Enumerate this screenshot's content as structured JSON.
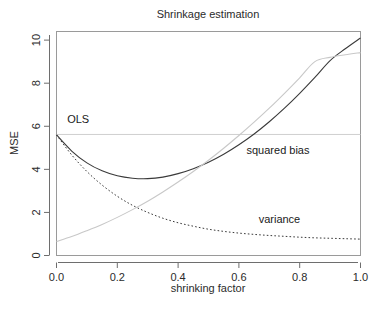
{
  "chart_data": {
    "type": "line",
    "title": "Shrinkage estimation",
    "xlabel": "shrinking factor",
    "ylabel": "MSE",
    "xlim": [
      0.0,
      1.0
    ],
    "ylim": [
      0.0,
      10.4
    ],
    "grid": false,
    "legend_position": "inline-annotations",
    "xticks": [
      0.0,
      0.2,
      0.4,
      0.6,
      0.8,
      1.0
    ],
    "xticklabels": [
      "0.0",
      "0.2",
      "0.4",
      "0.6",
      "0.8",
      "1.0"
    ],
    "yticks": [
      0,
      2,
      4,
      6,
      8,
      10
    ],
    "yticklabels": [
      "0",
      "2",
      "4",
      "6",
      "8",
      "10"
    ],
    "x": [
      0.0,
      0.05,
      0.1,
      0.15,
      0.2,
      0.25,
      0.3,
      0.35,
      0.4,
      0.45,
      0.5,
      0.55,
      0.6,
      0.65,
      0.7,
      0.75,
      0.8,
      0.85,
      0.9,
      0.95,
      1.0
    ],
    "series": [
      {
        "name": "MSE",
        "style": "solid",
        "color": "#3a3a3a",
        "values": [
          5.6,
          4.85,
          4.3,
          3.93,
          3.7,
          3.59,
          3.57,
          3.64,
          3.8,
          4.03,
          4.33,
          4.7,
          5.14,
          5.64,
          6.21,
          6.84,
          7.53,
          8.27,
          9.05,
          9.6,
          10.1
        ]
      },
      {
        "name": "variance",
        "style": "dashed",
        "color": "#3a3a3a",
        "values": [
          5.6,
          4.67,
          3.9,
          3.27,
          2.75,
          2.33,
          2.0,
          1.73,
          1.52,
          1.36,
          1.22,
          1.12,
          1.04,
          0.98,
          0.93,
          0.89,
          0.85,
          0.82,
          0.8,
          0.78,
          0.76
        ]
      },
      {
        "name": "squared bias",
        "style": "solid",
        "color": "#c8c8c8",
        "values": [
          0.65,
          0.88,
          1.15,
          1.44,
          1.77,
          2.13,
          2.52,
          2.95,
          3.41,
          3.9,
          4.42,
          4.98,
          5.57,
          6.19,
          6.84,
          7.53,
          8.25,
          9.0,
          9.2,
          9.32,
          9.42
        ]
      }
    ],
    "reference_line": {
      "name": "OLS",
      "orientation": "horizontal",
      "value": 5.62,
      "color": "#cfcfcf"
    },
    "annotations": [
      {
        "text": "OLS",
        "x": 0.035,
        "y": 6.15
      },
      {
        "text": "squared bias",
        "x": 0.625,
        "y": 4.72
      },
      {
        "text": "variance",
        "x": 0.665,
        "y": 1.52
      }
    ]
  }
}
